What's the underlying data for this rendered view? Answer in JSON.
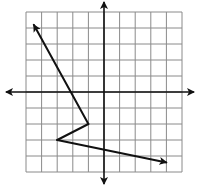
{
  "diagram": {
    "type": "coordinate-grid-vector-path",
    "canvas": {
      "width": 200,
      "height": 187
    },
    "grid": {
      "x_min": -5,
      "x_max": 5,
      "y_min": -5,
      "y_max": 5,
      "columns": 10,
      "rows": 10,
      "left_px": 26,
      "top_px": 12,
      "cell_w_px": 15.6,
      "cell_h_px": 16,
      "line_color": "#8a8a8a"
    },
    "axes": {
      "origin_px": [
        104,
        92
      ],
      "x_axis": {
        "from_px": 6,
        "to_px": 194,
        "arrows": "both"
      },
      "y_axis": {
        "from_px": 2,
        "to_px": 184,
        "arrows": "both"
      },
      "color": "#111111"
    },
    "path": {
      "color": "#111111",
      "points": [
        {
          "x": -4.5,
          "y": 4.2,
          "label": "",
          "arrow": true
        },
        {
          "x": -1,
          "y": -2,
          "label": "",
          "arrow": false
        },
        {
          "x": -3,
          "y": -3,
          "label": "",
          "arrow": false
        },
        {
          "x": 4,
          "y": -4.4,
          "label": "",
          "arrow": true
        }
      ]
    }
  }
}
